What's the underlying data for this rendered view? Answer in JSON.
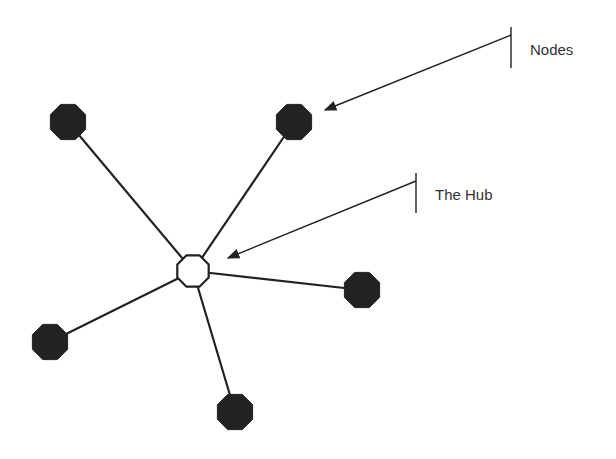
{
  "diagram": {
    "colors": {
      "node_fill": "#222222",
      "hub_fill": "#ffffff",
      "stroke": "#222222",
      "text": "#333333",
      "background": "#ffffff"
    },
    "hub": {
      "id": "hub",
      "x": 193,
      "y": 271,
      "r": 17
    },
    "nodes": [
      {
        "id": "node-top-left",
        "x": 68,
        "y": 122,
        "r": 19
      },
      {
        "id": "node-top-right",
        "x": 294,
        "y": 122,
        "r": 19
      },
      {
        "id": "node-right",
        "x": 362,
        "y": 290,
        "r": 19
      },
      {
        "id": "node-left",
        "x": 50,
        "y": 342,
        "r": 19
      },
      {
        "id": "node-bottom",
        "x": 235,
        "y": 412,
        "r": 19
      }
    ],
    "callouts": [
      {
        "id": "nodes-callout",
        "label": "Nodes",
        "label_x": 530,
        "label_y": 41,
        "bar": {
          "x": 511,
          "y1": 27,
          "y2": 68
        },
        "arrow": {
          "x1": 511,
          "y1": 35,
          "x2": 325,
          "y2": 110
        }
      },
      {
        "id": "hub-callout",
        "label": "The Hub",
        "label_x": 435,
        "label_y": 186,
        "bar": {
          "x": 416,
          "y1": 173,
          "y2": 213
        },
        "arrow": {
          "x1": 416,
          "y1": 181,
          "x2": 228,
          "y2": 258
        }
      }
    ]
  }
}
